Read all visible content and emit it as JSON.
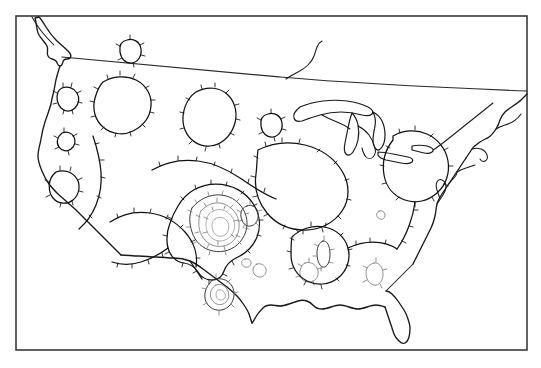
{
  "figure": {
    "kind": "contour-map",
    "region_label": "Continental United States",
    "background_color": "#ffffff",
    "frame": {
      "x": 16,
      "y": 16,
      "width": 511,
      "height": 334,
      "stroke_color": "#3a3a3a",
      "stroke_width": 1.6
    },
    "has_title": false,
    "has_legend": false,
    "has_axis_labels": false,
    "has_colorbar": false,
    "has_text_labels": false
  },
  "chart_data": {
    "type": "contour",
    "title": "",
    "subtitle": "",
    "xlabel": "",
    "ylabel": "",
    "grid": false,
    "legend": "none",
    "projection": "conic-united-states",
    "line_style": "hachured closed contours (depression contours)",
    "colors": {
      "coastline": "#1a1a1a",
      "contour_major": "#111111",
      "contour_mid": "#3d3d3d",
      "contour_minor": "#7d7d7d",
      "contour_faint": "#9a9a9a",
      "frame": "#3a3a3a",
      "background": "#ffffff"
    },
    "contour_levels": [
      1,
      2,
      3,
      4,
      5
    ],
    "features": [
      {
        "name": "southern-plains-core",
        "kind": "closed-nested-minimum",
        "center_x": 224,
        "center_y": 224,
        "ring_count": 5,
        "depth_level": 5,
        "hachured": true
      },
      {
        "name": "great-basin-cell",
        "kind": "closed-contour",
        "center_x": 69,
        "center_y": 98,
        "ring_count": 1,
        "depth_level": 1,
        "hachured": true
      },
      {
        "name": "northern-rockies-cell",
        "kind": "closed-contour",
        "center_x": 122,
        "center_y": 107,
        "ring_count": 1,
        "depth_level": 1,
        "hachured": true
      },
      {
        "name": "montana-cell",
        "kind": "closed-contour",
        "center_x": 133,
        "center_y": 49,
        "ring_count": 1,
        "depth_level": 1,
        "hachured": true
      },
      {
        "name": "nevada-cell",
        "kind": "closed-contour",
        "center_x": 67,
        "center_y": 141,
        "ring_count": 1,
        "depth_level": 1,
        "hachured": true
      },
      {
        "name": "california-cell",
        "kind": "closed-contour",
        "center_x": 64,
        "center_y": 186,
        "ring_count": 1,
        "depth_level": 1,
        "hachured": true
      },
      {
        "name": "dakotas-cell",
        "kind": "closed-contour",
        "center_x": 215,
        "center_y": 112,
        "ring_count": 1,
        "depth_level": 1,
        "hachured": true
      },
      {
        "name": "nebraska-cell",
        "kind": "closed-contour",
        "center_x": 273,
        "center_y": 124,
        "ring_count": 1,
        "depth_level": 1,
        "hachured": true
      },
      {
        "name": "south-texas-cell",
        "kind": "closed-nested-minimum",
        "center_x": 222,
        "center_y": 290,
        "ring_count": 3,
        "depth_level": 2,
        "hachured": true
      },
      {
        "name": "gulf-coast-cell",
        "kind": "closed-contour",
        "center_x": 262,
        "center_y": 271,
        "ring_count": 1,
        "depth_level": 1,
        "hachured": true
      },
      {
        "name": "louisiana-cell",
        "kind": "closed-contour",
        "center_x": 311,
        "center_y": 271,
        "ring_count": 1,
        "depth_level": 1,
        "hachured": true
      },
      {
        "name": "florida-cell",
        "kind": "closed-contour",
        "center_x": 378,
        "center_y": 273,
        "ring_count": 1,
        "depth_level": 1,
        "hachured": true
      },
      {
        "name": "appalachian-cell",
        "kind": "closed-contour",
        "center_x": 330,
        "center_y": 234,
        "ring_count": 1,
        "depth_level": 1,
        "hachured": true
      },
      {
        "name": "carolina-point-cell",
        "kind": "closed-contour",
        "center_x": 382,
        "center_y": 214,
        "ring_count": 1,
        "depth_level": 1,
        "hachured": false
      },
      {
        "name": "southeast-small-cell",
        "kind": "closed-contour",
        "center_x": 248,
        "center_y": 262,
        "ring_count": 1,
        "depth_level": 1,
        "hachured": false
      }
    ],
    "geography": [
      "pacific-northwest-coast",
      "west-coast",
      "mexico-border",
      "gulf-coast",
      "florida-peninsula",
      "atlantic-coast",
      "new-england",
      "great-lakes",
      "canada-border"
    ]
  }
}
